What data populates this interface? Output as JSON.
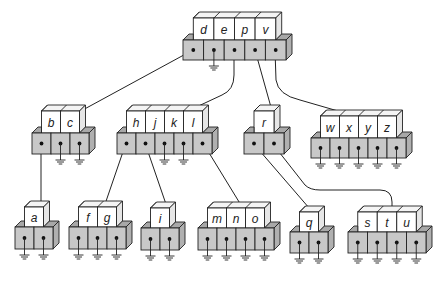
{
  "colors": {
    "key_fill": "#ffffff",
    "key_top": "#f4f4f4",
    "ptr_fill": "#c8c8c8",
    "ptr_side": "#b0b0b0",
    "ptr_top": "#a8a8a8",
    "stroke": "#222222",
    "line": "#222222"
  },
  "nodes": [
    {
      "id": "root",
      "keys": [
        "d",
        "e",
        "p",
        "v"
      ],
      "x": 183,
      "y": 40,
      "cell": 20.6,
      "key_h": 22,
      "ptr_h": 20,
      "grounded": [
        1
      ]
    },
    {
      "id": "bc",
      "keys": [
        "b",
        "c"
      ],
      "x": 32,
      "y": 133,
      "cell": 19,
      "key_h": 22,
      "ptr_h": 21,
      "grounded": [
        1,
        2
      ]
    },
    {
      "id": "hjkl",
      "keys": [
        "h",
        "j",
        "k",
        "l"
      ],
      "x": 117,
      "y": 133,
      "cell": 19,
      "key_h": 22,
      "ptr_h": 21,
      "grounded": [
        2,
        3
      ]
    },
    {
      "id": "r",
      "keys": [
        "r"
      ],
      "x": 244,
      "y": 133,
      "cell": 20,
      "key_h": 22,
      "ptr_h": 21,
      "grounded": []
    },
    {
      "id": "wxyz",
      "keys": [
        "w",
        "x",
        "y",
        "z"
      ],
      "x": 311,
      "y": 138,
      "cell": 19,
      "key_h": 22,
      "ptr_h": 20,
      "grounded": [
        0,
        1,
        2,
        3,
        4
      ]
    },
    {
      "id": "a",
      "keys": [
        "a"
      ],
      "x": 15,
      "y": 227,
      "cell": 19,
      "key_h": 20,
      "ptr_h": 22,
      "grounded": [
        0,
        1
      ]
    },
    {
      "id": "fg",
      "keys": [
        "f",
        "g"
      ],
      "x": 69,
      "y": 227,
      "cell": 19,
      "key_h": 20,
      "ptr_h": 22,
      "grounded": [
        0,
        1,
        2
      ]
    },
    {
      "id": "i",
      "keys": [
        "i"
      ],
      "x": 141,
      "y": 228,
      "cell": 19,
      "key_h": 20,
      "ptr_h": 22,
      "grounded": [
        0,
        1
      ]
    },
    {
      "id": "mno",
      "keys": [
        "m",
        "n",
        "o"
      ],
      "x": 198,
      "y": 228,
      "cell": 19,
      "key_h": 20,
      "ptr_h": 22,
      "grounded": [
        0,
        1,
        2,
        3
      ]
    },
    {
      "id": "q",
      "keys": [
        "q"
      ],
      "x": 290,
      "y": 232,
      "cell": 19,
      "key_h": 20,
      "ptr_h": 21,
      "grounded": [
        0,
        1
      ]
    },
    {
      "id": "stu",
      "keys": [
        "s",
        "t",
        "u"
      ],
      "x": 348,
      "y": 232,
      "cell": 19.5,
      "key_h": 20,
      "ptr_h": 21,
      "grounded": [
        0,
        1,
        2,
        3
      ]
    }
  ],
  "edges": [
    {
      "from": "root",
      "ptr": 0,
      "to": "bc",
      "path": "M193,50 L68,118"
    },
    {
      "from": "root",
      "ptr": 2,
      "to": "hjkl",
      "path": "M234,50 L234,75 Q234,90 222,95 L175,117"
    },
    {
      "from": "root",
      "ptr": 3,
      "to": "r",
      "path": "M255,50 L274,118"
    },
    {
      "from": "root",
      "ptr": 4,
      "to": "wxyz",
      "path": "M275,50 L276,80 Q278,95 300,100 L376,122"
    },
    {
      "from": "bc",
      "ptr": 0,
      "to": "a",
      "path": "M41,143 L41,212"
    },
    {
      "from": "hjkl",
      "ptr": 0,
      "to": "fg",
      "path": "M126,143 L103,210"
    },
    {
      "from": "hjkl",
      "ptr": 1,
      "to": "i",
      "path": "M145,143 L168,210"
    },
    {
      "from": "hjkl",
      "ptr": 4,
      "to": "mno",
      "path": "M203,143 L244,210"
    },
    {
      "from": "r",
      "ptr": 0,
      "to": "q",
      "path": "M253,143 L316,216"
    },
    {
      "from": "r",
      "ptr": 1,
      "to": "stu",
      "path": "M272,143 L305,185 Q310,190 320,190 L380,190 Q392,190 392,202 L392,215"
    }
  ]
}
